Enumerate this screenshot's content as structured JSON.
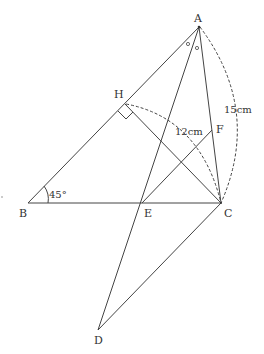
{
  "diagram": {
    "type": "geometry",
    "points": {
      "A": {
        "label": "A",
        "x": 199,
        "y": 27
      },
      "B": {
        "label": "B",
        "x": 28,
        "y": 203
      },
      "C": {
        "label": "C",
        "x": 221,
        "y": 203
      },
      "D": {
        "label": "D",
        "x": 98,
        "y": 330
      },
      "E": {
        "label": "E",
        "x": 142,
        "y": 203
      },
      "F": {
        "label": "F",
        "x": 212,
        "y": 130
      },
      "H": {
        "label": "H",
        "x": 125,
        "y": 104
      }
    },
    "annotations": {
      "angle_B": "45°",
      "length_AC": "15cm",
      "length_CH": "12cm",
      "equal_angle_marks": "∘"
    },
    "colors": {
      "line": "#444444",
      "text": "#333333",
      "background": "#ffffff"
    }
  }
}
